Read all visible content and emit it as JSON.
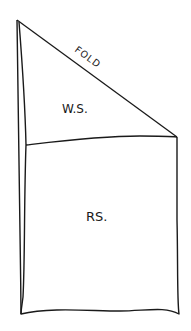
{
  "diagram": {
    "type": "sewing-fold-diagram",
    "labels": {
      "fold": "FOLD",
      "wrong_side": "W.S.",
      "right_side": "RS."
    },
    "colors": {
      "line": "#1a1a1a",
      "background": "#ffffff"
    }
  }
}
